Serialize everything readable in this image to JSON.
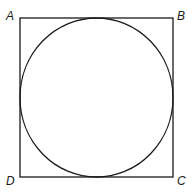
{
  "diagram": {
    "stroke_color": "#1a1a1a",
    "vertices": {
      "A": {
        "label": "A",
        "position": "top-left"
      },
      "B": {
        "label": "B",
        "position": "top-right"
      },
      "C": {
        "label": "C",
        "position": "bottom-right"
      },
      "D": {
        "label": "D",
        "position": "bottom-left"
      }
    }
  }
}
